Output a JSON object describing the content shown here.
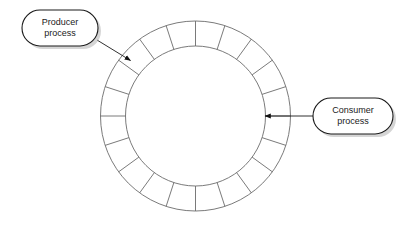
{
  "diagram": {
    "type": "circular-buffer-producer-consumer",
    "canvas": {
      "width": 405,
      "height": 225,
      "background": "#ffffff"
    },
    "ring": {
      "name": "circular-buffer-ring",
      "center_x": 195.5,
      "center_y": 116,
      "outer_radius": 95,
      "inner_radius": 70,
      "segment_count": 20,
      "segment_angle_degrees": 18,
      "start_angle_degrees": -90,
      "stroke_color": "#6b6b6b",
      "fill_color": "#ffffff",
      "stroke_width": 0.9
    },
    "nodes": [
      {
        "id": "producer",
        "name": "producer-process-node",
        "line1": "Producer",
        "line2": "process",
        "x": 22,
        "y": 10,
        "width": 76,
        "height": 36,
        "shape": "stadium",
        "stroke_color": "#1a1a1a",
        "fill_color": "#ffffff",
        "shadow_color": "#b3b3b3"
      },
      {
        "id": "consumer",
        "name": "consumer-process-node",
        "line1": "Consumer",
        "line2": "process",
        "x": 313,
        "y": 98,
        "width": 80,
        "height": 36,
        "shape": "stadium",
        "stroke_color": "#1a1a1a",
        "fill_color": "#ffffff",
        "shadow_color": "#b3b3b3"
      }
    ],
    "arrows": [
      {
        "id": "producer-arrow",
        "name": "producer-to-buffer-arrow",
        "from": "producer",
        "to": "circular-buffer-ring",
        "x1": 97,
        "y1": 40,
        "x2": 130.5,
        "y2": 60.5,
        "stroke_color": "#1a1a1a",
        "target_angle_degrees": 135
      },
      {
        "id": "consumer-arrow",
        "name": "consumer-to-buffer-arrow",
        "from": "consumer",
        "to": "circular-buffer-ring",
        "x1": 313,
        "y1": 116,
        "x2": 265,
        "y2": 116,
        "stroke_color": "#1a1a1a",
        "target_angle_degrees": 0
      }
    ]
  }
}
